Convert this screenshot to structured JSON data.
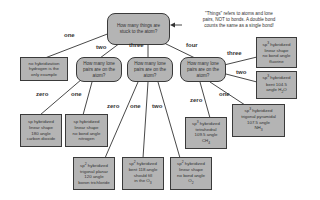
{
  "root": {
    "question": "How many things are stuck to the atom?"
  },
  "note": {
    "lines": [
      "\"Things\" refers to atoms and lone",
      "pairs, NOT to bonds.  A double bond",
      "counts the same as a single bond!"
    ]
  },
  "edges_top": {
    "one": "one",
    "two": "two",
    "three": "three",
    "four": "four"
  },
  "nodes": {
    "no_hybrid": {
      "lines": [
        "no hybridization",
        "hydrogen is the",
        "only example"
      ]
    },
    "q_two": {
      "question": "How many lone pairs are on the atom?"
    },
    "q_three": {
      "question": "How many lone pairs are on the atom?"
    },
    "q_four": {
      "question": "How many lone pairs are on the atom?"
    }
  },
  "edges_two": {
    "zero": "zero",
    "one": "one"
  },
  "edges_three": {
    "zero": "zero",
    "one": "one",
    "two": "two"
  },
  "edges_four": {
    "zero": "zero",
    "one": "one",
    "two": "two",
    "three": "three"
  },
  "leaves": {
    "co2": {
      "l1": "sp hybridized",
      "l2": "linear shape",
      "l3": "180 angle",
      "l4": "carbon dioxide"
    },
    "nitrogen": {
      "l1": "sp hybridized",
      "l2": "linear shape",
      "l3": "no bond angle",
      "l4": "nitrogen"
    },
    "bcl3": {
      "hyb": "sp",
      "hyb_sup": "2",
      "hyb_rest": " hybridized",
      "l2": "trigonal planar",
      "l3": "120 angle",
      "l4": "boron trichloride"
    },
    "o3": {
      "hyb": "sp",
      "hyb_sup": "2",
      "hyb_rest": " hybridized",
      "l2": "bent 118 angle",
      "l3": "should fill",
      "l4": "in the O",
      "l4_sub": "3"
    },
    "o2": {
      "hyb": "sp",
      "hyb_sup": "2",
      "hyb_rest": " hybridized",
      "l2": "linear shape",
      "l3": "no bond angle",
      "l4": "O",
      "l4_sub": "2"
    },
    "ch4": {
      "hyb": "sp",
      "hyb_sup": "3",
      "hyb_rest": " hybridized",
      "l2": "tetrahedral",
      "l3": "109.5 angle",
      "l4": "CH",
      "l4_sub": "4"
    },
    "nh3": {
      "hyb": "sp",
      "hyb_sup": "3",
      "hyb_rest": " hybridized",
      "l2": "trigonal pyramidal",
      "l3": "107.5 angle",
      "l4": "NH",
      "l4_sub": "3"
    },
    "h2o": {
      "hyb": "sp",
      "hyb_sup": "3",
      "hyb_rest": " hybridized",
      "l2": "bent 104.5",
      "l3": "angle H",
      "l3_sub": "2",
      "l3_rest": "O"
    },
    "fluorine": {
      "hyb": "sp",
      "hyb_sup": "3",
      "hyb_rest": " hybridized",
      "l2": "linear shape",
      "l3": "no bond angle",
      "l4": "fluorine"
    }
  },
  "colors": {
    "box_fill": "#b4b4b4",
    "border": "#3a3a3a",
    "text": "#333333"
  }
}
